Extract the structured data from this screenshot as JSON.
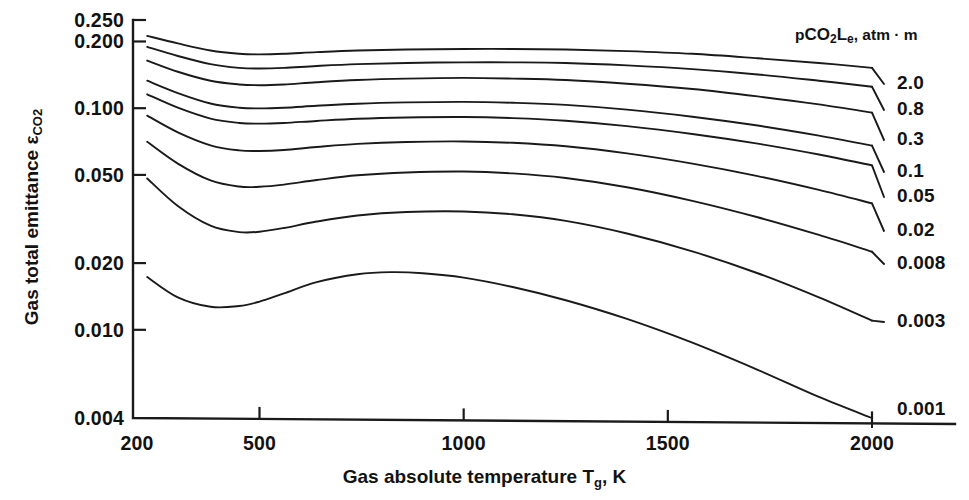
{
  "chart_data": {
    "type": "line",
    "title": "",
    "xlabel": "Gas absolute temperature Tg, K",
    "ylabel": "Gas total emittance εCO2",
    "xlabel_parts": {
      "main": "Gas absolute temperature T",
      "sub": "g",
      "tail": ", K"
    },
    "ylabel_parts": {
      "main": "Gas total emittance ε",
      "sub": "CO",
      "sub2": "2"
    },
    "legend_title": "pCO2Le, atm · m",
    "legend_title_parts": {
      "p": "p",
      "sub1": "CO",
      "sub2": "2",
      "L": "L",
      "sube": "e",
      "tail": ", atm · m"
    },
    "legend_position": "right",
    "grid": false,
    "xscale": "linear",
    "yscale": "log",
    "xlim": [
      155,
      2085
    ],
    "ylim": [
      0.004,
      0.25
    ],
    "xticks": [
      200,
      500,
      1000,
      1500,
      2000
    ],
    "xtick_labels": [
      "200",
      "500",
      "1000",
      "1500",
      "2000"
    ],
    "yticks": [
      0.004,
      0.01,
      0.02,
      0.05,
      0.1,
      0.2,
      0.25
    ],
    "ytick_labels": [
      "0.004",
      "0.010",
      "0.020",
      "0.050",
      "0.100",
      "0.200",
      "0.250"
    ],
    "series": [
      {
        "name": "2.0",
        "label": "2.0",
        "x": [
          225,
          300,
          380,
          450,
          500,
          560,
          640,
          740,
          860,
          1000,
          1120,
          1250,
          1400,
          1560,
          1720,
          1870,
          2000
        ],
        "values": [
          0.212,
          0.196,
          0.182,
          0.176,
          0.175,
          0.176,
          0.179,
          0.182,
          0.184,
          0.185,
          0.185,
          0.184,
          0.181,
          0.176,
          0.168,
          0.16,
          0.152
        ]
      },
      {
        "name": "0.8",
        "label": "0.8",
        "x": [
          225,
          300,
          380,
          450,
          500,
          560,
          640,
          740,
          860,
          1000,
          1120,
          1250,
          1400,
          1560,
          1720,
          1870,
          2000
        ],
        "values": [
          0.189,
          0.172,
          0.158,
          0.152,
          0.151,
          0.152,
          0.155,
          0.158,
          0.16,
          0.161,
          0.161,
          0.16,
          0.156,
          0.15,
          0.142,
          0.133,
          0.125
        ]
      },
      {
        "name": "0.3",
        "label": "0.3",
        "x": [
          225,
          300,
          380,
          450,
          500,
          560,
          640,
          740,
          860,
          1000,
          1120,
          1250,
          1400,
          1560,
          1720,
          1870,
          2000
        ],
        "values": [
          0.164,
          0.146,
          0.133,
          0.128,
          0.127,
          0.128,
          0.131,
          0.134,
          0.136,
          0.137,
          0.136,
          0.134,
          0.129,
          0.122,
          0.113,
          0.104,
          0.0955
        ]
      },
      {
        "name": "0.1",
        "label": "0.1",
        "x": [
          225,
          300,
          380,
          450,
          500,
          560,
          640,
          740,
          860,
          1000,
          1120,
          1250,
          1400,
          1560,
          1720,
          1870,
          2000
        ],
        "values": [
          0.133,
          0.117,
          0.105,
          0.1005,
          0.0998,
          0.1005,
          0.1025,
          0.1048,
          0.1062,
          0.1068,
          0.1058,
          0.1035,
          0.0985,
          0.0915,
          0.0835,
          0.0752,
          0.0678
        ]
      },
      {
        "name": "0.05",
        "label": "0.05",
        "x": [
          225,
          300,
          380,
          450,
          500,
          560,
          640,
          740,
          860,
          1000,
          1120,
          1250,
          1400,
          1560,
          1720,
          1870,
          2000
        ],
        "values": [
          0.1155,
          0.1005,
          0.0898,
          0.0858,
          0.0852,
          0.0858,
          0.0876,
          0.0896,
          0.0908,
          0.0912,
          0.0902,
          0.0878,
          0.083,
          0.0765,
          0.0692,
          0.0618,
          0.0552
        ]
      },
      {
        "name": "0.02",
        "label": "0.02",
        "x": [
          225,
          300,
          380,
          450,
          500,
          560,
          640,
          740,
          860,
          1000,
          1120,
          1250,
          1400,
          1560,
          1720,
          1870,
          2000
        ],
        "values": [
          0.0925,
          0.0778,
          0.068,
          0.0645,
          0.0641,
          0.0648,
          0.0668,
          0.069,
          0.0704,
          0.0708,
          0.0698,
          0.0673,
          0.0625,
          0.0562,
          0.0494,
          0.0428,
          0.0372
        ]
      },
      {
        "name": "0.008",
        "label": "0.008",
        "x": [
          225,
          300,
          380,
          450,
          500,
          560,
          640,
          740,
          860,
          1000,
          1120,
          1250,
          1400,
          1560,
          1720,
          1870,
          2000
        ],
        "values": [
          0.0705,
          0.0562,
          0.0472,
          0.0443,
          0.0442,
          0.0452,
          0.0474,
          0.0498,
          0.0513,
          0.0518,
          0.0508,
          0.0484,
          0.044,
          0.0382,
          0.0322,
          0.0268,
          0.0225
        ]
      },
      {
        "name": "0.003",
        "label": "0.003",
        "x": [
          225,
          300,
          380,
          450,
          500,
          560,
          640,
          740,
          860,
          1000,
          1120,
          1250,
          1400,
          1560,
          1720,
          1870,
          2000
        ],
        "values": [
          0.0482,
          0.0362,
          0.0295,
          0.0276,
          0.0277,
          0.0288,
          0.0308,
          0.0328,
          0.034,
          0.0342,
          0.0332,
          0.031,
          0.0272,
          0.0226,
          0.018,
          0.014,
          0.011
        ]
      },
      {
        "name": "0.001",
        "label": "0.001",
        "x": [
          225,
          300,
          380,
          450,
          500,
          560,
          640,
          740,
          820,
          900,
          1000,
          1120,
          1250,
          1400,
          1560,
          1720,
          1870,
          2000
        ],
        "values": [
          0.0173,
          0.014,
          0.0127,
          0.0128,
          0.0134,
          0.0146,
          0.0164,
          0.0178,
          0.0182,
          0.018,
          0.0172,
          0.0156,
          0.0136,
          0.0112,
          0.00875,
          0.0066,
          0.00498,
          0.004
        ]
      }
    ],
    "colors": {
      "curve": "#1a1a1a",
      "axis": "#1a1a1a",
      "background": "#ffffff"
    }
  }
}
